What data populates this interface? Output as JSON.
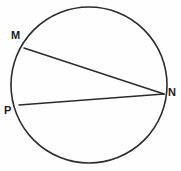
{
  "figure": {
    "type": "geometry-diagram",
    "background_color": "#fefefe",
    "stroke_color": "#2b2b2b",
    "label_color": "#1a1a1a",
    "width": 181,
    "height": 171,
    "circle": {
      "name": "circle",
      "cx": 89,
      "cy": 85,
      "r": 78,
      "stroke_width": 1.6
    },
    "points": [
      {
        "id": "M",
        "label": "M",
        "x": 24,
        "y": 48
      },
      {
        "id": "N",
        "label": "N",
        "x": 164,
        "y": 94
      },
      {
        "id": "P",
        "label": "P",
        "x": 19,
        "y": 105
      }
    ],
    "chords": [
      {
        "id": "MN",
        "from": "M",
        "to": "N",
        "x1": 24,
        "y1": 48,
        "x2": 164,
        "y2": 94,
        "stroke_width": 1.5
      },
      {
        "id": "PN",
        "from": "P",
        "to": "N",
        "x1": 19,
        "y1": 105,
        "x2": 164,
        "y2": 94,
        "stroke_width": 1.5
      }
    ]
  }
}
